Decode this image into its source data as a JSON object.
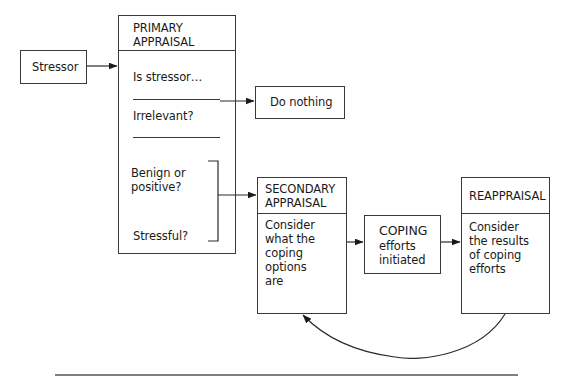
{
  "diagram": {
    "stressor": {
      "label": "Stressor"
    },
    "primary_appraisal": {
      "title": "PRIMARY\nAPPRAISAL",
      "question": "Is stressor…",
      "options": [
        {
          "label": "Irrelevant?"
        },
        {
          "label": "Benign or\npositive?"
        },
        {
          "label": "Stressful?"
        }
      ]
    },
    "do_nothing": {
      "label": "Do nothing"
    },
    "secondary_appraisal": {
      "title": "SECONDARY\nAPPRAISAL",
      "body": "Consider\nwhat the\ncoping\noptions\nare"
    },
    "coping": {
      "title": "COPING",
      "body": "efforts\ninitiated"
    },
    "reappraisal": {
      "title": "REAPPRAISAL",
      "body": "Consider\nthe results\nof coping\nefforts"
    },
    "edges": [
      {
        "from": "stressor",
        "to": "primary_appraisal"
      },
      {
        "from": "irrelevant",
        "to": "do_nothing"
      },
      {
        "from": "benign_or_stressful",
        "to": "secondary_appraisal"
      },
      {
        "from": "secondary_appraisal",
        "to": "coping"
      },
      {
        "from": "coping",
        "to": "reappraisal"
      },
      {
        "from": "reappraisal",
        "to": "secondary_appraisal",
        "style": "curved-feedback"
      }
    ]
  }
}
